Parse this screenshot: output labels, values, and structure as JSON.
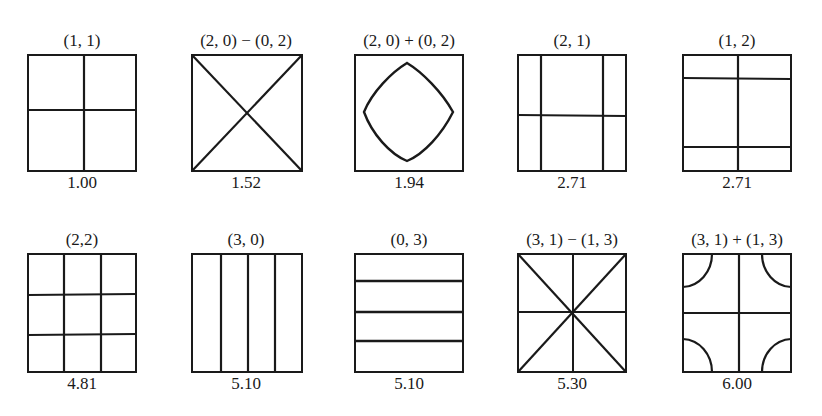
{
  "figure": {
    "panels": [
      {
        "mode": "(1, 1)",
        "eigenvalue": "1.00"
      },
      {
        "mode": "(2, 0) − (0, 2)",
        "eigenvalue": "1.52"
      },
      {
        "mode": "(2, 0) + (0, 2)",
        "eigenvalue": "1.94"
      },
      {
        "mode": "(2, 1)",
        "eigenvalue": "2.71"
      },
      {
        "mode": "(1, 2)",
        "eigenvalue": "2.71"
      },
      {
        "mode": "(2,2)",
        "eigenvalue": "4.81"
      },
      {
        "mode": "(3, 0)",
        "eigenvalue": "5.10"
      },
      {
        "mode": "(0, 3)",
        "eigenvalue": "5.10"
      },
      {
        "mode": "(3, 1) − (1, 3)",
        "eigenvalue": "5.30"
      },
      {
        "mode": "(3, 1) + (1, 3)",
        "eigenvalue": "6.00"
      }
    ]
  }
}
